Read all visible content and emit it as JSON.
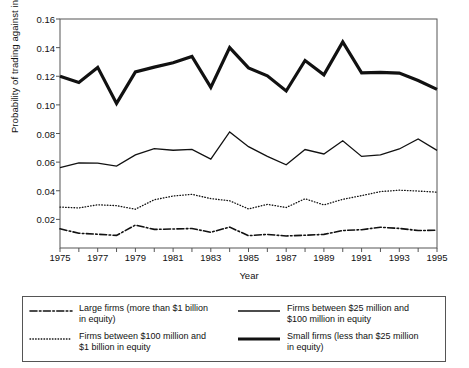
{
  "chart_data": {
    "type": "line",
    "title": "",
    "xlabel": "Year",
    "ylabel": "Probability of trading against insiders",
    "xlim": [
      1975,
      1995
    ],
    "ylim": [
      0,
      0.16
    ],
    "grid": false,
    "legend_position": "bottom",
    "x": [
      1975,
      1976,
      1977,
      1978,
      1979,
      1980,
      1981,
      1982,
      1983,
      1984,
      1985,
      1986,
      1987,
      1988,
      1989,
      1990,
      1991,
      1992,
      1993,
      1994,
      1995
    ],
    "xticks": [
      1975,
      1977,
      1979,
      1981,
      1983,
      1985,
      1987,
      1989,
      1991,
      1993,
      1995
    ],
    "xtick_labels": [
      "1975",
      "1977",
      "1979",
      "1981",
      "1983",
      "1985",
      "1987",
      "1989",
      "1991",
      "1993",
      "1995"
    ],
    "yticks": [
      0.02,
      0.04,
      0.06,
      0.08,
      0.1,
      0.12,
      0.14,
      0.16
    ],
    "ytick_labels": [
      "0.02",
      "0.04",
      "0.06",
      "0.08",
      "0.10",
      "0.12",
      "0.14",
      "0.16"
    ],
    "series": [
      {
        "name": "Large firms (more than $1 billion in equity)",
        "style": "dashdot",
        "width": 1.6,
        "color": "#111111",
        "values": [
          0.0134,
          0.0103,
          0.0096,
          0.0088,
          0.016,
          0.013,
          0.0133,
          0.0136,
          0.011,
          0.0146,
          0.0086,
          0.0095,
          0.0084,
          0.0089,
          0.0095,
          0.0122,
          0.0128,
          0.0145,
          0.0137,
          0.0122,
          0.0124
        ]
      },
      {
        "name": "Firms between $100 million and $1 billion in equity",
        "style": "dotted",
        "width": 1.3,
        "color": "#111111",
        "values": [
          0.0286,
          0.028,
          0.0302,
          0.0296,
          0.0271,
          0.0337,
          0.0363,
          0.0375,
          0.0345,
          0.033,
          0.0273,
          0.0305,
          0.0283,
          0.0344,
          0.0301,
          0.034,
          0.0366,
          0.0394,
          0.0404,
          0.0398,
          0.039
        ]
      },
      {
        "name": "Firms between $25 million and $100 million in equity",
        "style": "solid",
        "width": 1.3,
        "color": "#111111",
        "values": [
          0.0562,
          0.0594,
          0.0593,
          0.0572,
          0.065,
          0.0694,
          0.0683,
          0.0689,
          0.0621,
          0.0811,
          0.0708,
          0.064,
          0.0581,
          0.0688,
          0.0657,
          0.0749,
          0.064,
          0.065,
          0.0692,
          0.0762,
          0.0682
        ]
      },
      {
        "name": "Small firms (less than $25 million in equity)",
        "style": "thick",
        "width": 3.2,
        "color": "#111111",
        "values": [
          0.12,
          0.1157,
          0.1262,
          0.101,
          0.123,
          0.1264,
          0.1294,
          0.1338,
          0.1122,
          0.14,
          0.1258,
          0.1203,
          0.1097,
          0.131,
          0.121,
          0.144,
          0.1224,
          0.1227,
          0.1222,
          0.117,
          0.1108
        ]
      }
    ]
  },
  "legend": {
    "items": [
      {
        "style": "dashdot",
        "label": "Large firms (more than $1 billion\nin equity)"
      },
      {
        "style": "solid",
        "label": "Firms between $25 million and\n$100 million in equity"
      },
      {
        "style": "dotted",
        "label": "Firms between $100 million and\n$1 billion in equity"
      },
      {
        "style": "thick",
        "label": "Small firms (less than $25 million\nin equity)"
      }
    ]
  },
  "colors": {
    "line": "#111111",
    "axis": "#555555",
    "background": "#ffffff"
  }
}
